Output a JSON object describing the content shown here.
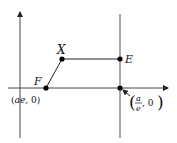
{
  "diagram": {
    "type": "ellipse focus-directrix construction",
    "colors": {
      "stroke": "#333333",
      "point": "#000000",
      "background": "#ffffff"
    },
    "axes": {
      "x_axis": {
        "y": 88,
        "from": 8,
        "to": 168,
        "arrow": true
      },
      "y_axis": {
        "x": 20,
        "from": 138,
        "to": 12,
        "arrow": true
      }
    },
    "directrix": {
      "x": 120,
      "from": 14,
      "to": 138
    },
    "points": [
      {
        "id": "F",
        "label": "F",
        "x": 46,
        "y": 88,
        "coord_label": "(ae, 0)"
      },
      {
        "id": "X",
        "label": "X",
        "x": 62,
        "y": 59
      },
      {
        "id": "E",
        "label": "E",
        "x": 120,
        "y": 59
      },
      {
        "id": "D",
        "label": "",
        "x": 120,
        "y": 88,
        "coord_label_num": "a",
        "coord_label_den": "e",
        "coord_label_tail": ", 0"
      }
    ],
    "segments": [
      {
        "from": "F",
        "to": "X"
      },
      {
        "from": "X",
        "to": "E"
      }
    ],
    "labels": {
      "F": "F",
      "X": "X",
      "E": "E",
      "F_coord_open": "(",
      "F_coord_ae": "ae",
      "F_coord_rest": ", 0)",
      "D_num": "a",
      "D_den": "e",
      "D_tail": ", 0",
      "D_open": "(",
      "D_close": ")"
    }
  }
}
